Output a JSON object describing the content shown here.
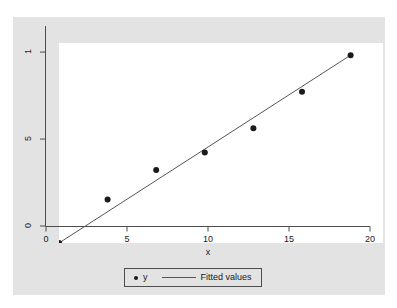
{
  "chart_data": {
    "type": "scatter",
    "title": "",
    "subtitle": "",
    "xlabel": "x",
    "ylabel": "",
    "xlim": [
      0,
      20
    ],
    "ylim": [
      0,
      1.15
    ],
    "xticks": [
      0,
      5,
      10,
      15,
      20
    ],
    "xtick_labels": [
      "0",
      "5",
      "10",
      "15",
      "20"
    ],
    "yticks": [
      0,
      0.5,
      1
    ],
    "ytick_labels": [
      "0",
      "5",
      "1"
    ],
    "grid": false,
    "legend_position": "bottom",
    "series": [
      {
        "name": "y",
        "type": "scatter",
        "marker": "filled-circle",
        "color": "#1a1a1a",
        "x": [
          0,
          3,
          6,
          9,
          12,
          15,
          18
        ],
        "values": [
          0.0,
          0.25,
          0.42,
          0.52,
          0.66,
          0.87,
          1.08
        ]
      },
      {
        "name": "Fitted values",
        "type": "line",
        "color": "#555555",
        "x": [
          0,
          18
        ],
        "values": [
          0.0,
          1.08
        ]
      }
    ],
    "legend": [
      {
        "label": "y",
        "marker": "dot-marker"
      },
      {
        "label": "Fitted values",
        "marker": "line-marker"
      }
    ],
    "colors": {
      "graph_region": "#e3e3e3",
      "plot_area": "#ffffff",
      "axis": "#4d4d4d",
      "marker": "#1a1a1a",
      "fit_line": "#555555",
      "text": "#1a1a1a"
    }
  }
}
